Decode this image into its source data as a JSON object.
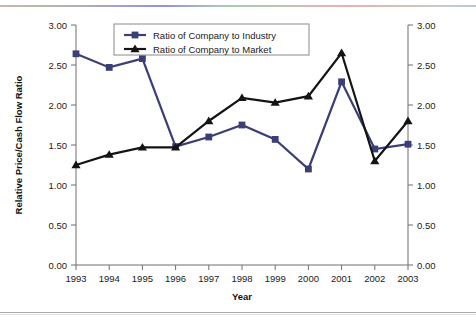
{
  "figure": {
    "background_color": "#ffffff",
    "top_rule_present": true,
    "bottom_rule_present": true
  },
  "chart_data": {
    "type": "line",
    "title": "",
    "xlabel": "Year",
    "ylabel": "Relative Price/Cash Flow Ratio",
    "ylabel_right": "",
    "categories": [
      "1993",
      "1994",
      "1995",
      "1996",
      "1997",
      "1998",
      "1999",
      "2000",
      "2001",
      "2002",
      "2003"
    ],
    "x": [
      1993,
      1994,
      1995,
      1996,
      1997,
      1998,
      1999,
      2000,
      2001,
      2002,
      2003
    ],
    "ylim": [
      0.0,
      3.0
    ],
    "ytick_values": [
      0.0,
      0.5,
      1.0,
      1.5,
      2.0,
      2.5,
      3.0
    ],
    "ytick_labels": [
      "0.00",
      "0.50",
      "1.00",
      "1.50",
      "2.00",
      "2.50",
      "3.00"
    ],
    "ytick_labels_right": [
      "0.00",
      "0.50",
      "1.00",
      "1.50",
      "2.00",
      "2.50",
      "3.00"
    ],
    "grid": false,
    "legend_position": "top-left-inside",
    "dual_axis": true,
    "series": [
      {
        "name": "Ratio of Company to Industry",
        "color": "#3b3f76",
        "marker": "square",
        "values": [
          2.64,
          2.47,
          2.58,
          1.48,
          1.6,
          1.75,
          1.57,
          1.2,
          2.29,
          1.45,
          1.51
        ]
      },
      {
        "name": "Ratio of Company to Market",
        "color": "#141414",
        "marker": "triangle",
        "values": [
          1.25,
          1.38,
          1.47,
          1.47,
          1.8,
          2.09,
          2.03,
          2.11,
          2.65,
          1.3,
          1.8
        ]
      }
    ]
  },
  "legend": {
    "entries": [
      {
        "label": "Ratio of Company to Industry"
      },
      {
        "label": "Ratio of Company to Market"
      }
    ]
  }
}
